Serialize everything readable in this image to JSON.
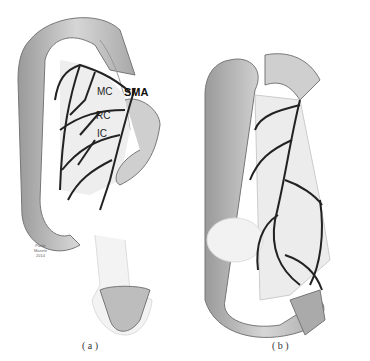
{
  "panel_a": {
    "labels": {
      "mc": "MC",
      "sma": "SMA",
      "rc": "RC",
      "ic": "IC"
    },
    "caption": "( a )",
    "credit": [
      "Paolo",
      "Masetti",
      "2014"
    ]
  },
  "panel_b": {
    "caption": "( b )"
  },
  "colors": {
    "colon": "#bdbdbd",
    "colon_dark": "#8a8a8a",
    "vessel": "#222222",
    "background": "#ffffff"
  }
}
